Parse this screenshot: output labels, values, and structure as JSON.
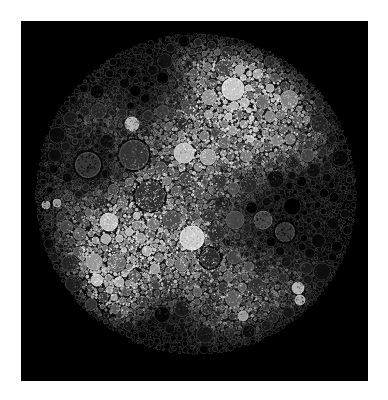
{
  "figure": {
    "title": "",
    "background_color": "#ffffff",
    "plot_background_color": "#000000",
    "frame": {
      "x": 21,
      "y": 21,
      "width": 347,
      "height": 360
    }
  },
  "chart_data": {
    "type": "circle-pack",
    "title": "",
    "subtitle": "",
    "xlabel": "",
    "ylabel": "",
    "grid": false,
    "legend": false,
    "colormap": "grayscale",
    "colormap_range": [
      "#000000",
      "#f0f0f0"
    ],
    "root": {
      "cx": 196,
      "cy": 194,
      "r": 161,
      "value": 1.0,
      "brightness": 0.06
    },
    "axis_ranges": {
      "x": [
        0,
        347
      ],
      "y": [
        0,
        360
      ]
    },
    "seed": 20240917,
    "total_circles": 3400,
    "depth_levels": 5,
    "brightness_field": {
      "description": "radial-plus-blob luminance field driving circle fill gray level",
      "base": 0.12,
      "blobs": [
        {
          "cx": 258,
          "cy": 96,
          "r": 70,
          "amp": 0.62
        },
        {
          "cx": 120,
          "cy": 232,
          "r": 62,
          "amp": 0.52
        },
        {
          "cx": 104,
          "cy": 302,
          "r": 42,
          "amp": 0.58
        },
        {
          "cx": 196,
          "cy": 150,
          "r": 58,
          "amp": 0.34
        },
        {
          "cx": 176,
          "cy": 250,
          "r": 54,
          "amp": 0.3
        },
        {
          "cx": 240,
          "cy": 300,
          "r": 58,
          "amp": 0.24
        },
        {
          "cx": 298,
          "cy": 180,
          "r": 48,
          "amp": 0.1
        },
        {
          "cx": 108,
          "cy": 120,
          "r": 50,
          "amp": 0.16
        },
        {
          "cx": 196,
          "cy": 60,
          "r": 56,
          "amp": 0.14
        },
        {
          "cx": 300,
          "cy": 260,
          "r": 46,
          "amp": 0.12
        }
      ],
      "dark_blobs": [
        {
          "cx": 300,
          "cy": 215,
          "r": 56,
          "amp": 0.4
        },
        {
          "cx": 150,
          "cy": 80,
          "r": 54,
          "amp": 0.3
        },
        {
          "cx": 96,
          "cy": 168,
          "r": 36,
          "amp": 0.3
        },
        {
          "cx": 150,
          "cy": 330,
          "r": 46,
          "amp": 0.26
        }
      ]
    },
    "highlight_circles": [
      {
        "name": "top-bright-large",
        "cx": 233,
        "cy": 89,
        "r": 11,
        "gray": 0.78
      },
      {
        "name": "upper-mid-bright",
        "cx": 184,
        "cy": 153,
        "r": 10,
        "gray": 0.74
      },
      {
        "name": "upper-mid-bright-small",
        "cx": 208,
        "cy": 157,
        "r": 8,
        "gray": 0.62
      },
      {
        "name": "upper-left-bright",
        "cx": 132,
        "cy": 124,
        "r": 7,
        "gray": 0.72
      },
      {
        "name": "center-bright-large",
        "cx": 192,
        "cy": 238,
        "r": 12,
        "gray": 0.8
      },
      {
        "name": "left-bright",
        "cx": 109,
        "cy": 222,
        "r": 9,
        "gray": 0.74
      },
      {
        "name": "dark-left-ringed",
        "cx": 88,
        "cy": 165,
        "r": 14,
        "gray": 0.22
      },
      {
        "name": "dark-upper-mid",
        "cx": 134,
        "cy": 155,
        "r": 16,
        "gray": 0.2
      },
      {
        "name": "dark-center",
        "cx": 150,
        "cy": 196,
        "r": 16,
        "gray": 0.18
      },
      {
        "name": "dark-center-low",
        "cx": 210,
        "cy": 258,
        "r": 11,
        "gray": 0.16
      },
      {
        "name": "mid-gray-right",
        "cx": 263,
        "cy": 220,
        "r": 9,
        "gray": 0.3
      },
      {
        "name": "mid-gray-right-2",
        "cx": 235,
        "cy": 220,
        "r": 9,
        "gray": 0.28
      },
      {
        "name": "mid-gray-left",
        "cx": 172,
        "cy": 220,
        "r": 9,
        "gray": 0.3
      },
      {
        "name": "mid-gray-lower-right",
        "cx": 285,
        "cy": 232,
        "r": 11,
        "gray": 0.22
      },
      {
        "name": "small-bright-right",
        "cx": 298,
        "cy": 288,
        "r": 6,
        "gray": 0.7
      },
      {
        "name": "small-bright-right-2",
        "cx": 300,
        "cy": 300,
        "r": 5,
        "gray": 0.66
      },
      {
        "name": "small-bright-lower",
        "cx": 243,
        "cy": 316,
        "r": 5,
        "gray": 0.62
      },
      {
        "name": "small-bright-edge-left",
        "cx": 46,
        "cy": 205,
        "r": 4,
        "gray": 0.6
      },
      {
        "name": "small-bright-edge-left-2",
        "cx": 57,
        "cy": 203,
        "r": 4,
        "gray": 0.58
      },
      {
        "name": "bright-lower-left",
        "cx": 97,
        "cy": 280,
        "r": 6,
        "gray": 0.72
      },
      {
        "name": "bright-lower-left-2",
        "cx": 119,
        "cy": 282,
        "r": 5,
        "gray": 0.66
      },
      {
        "name": "bright-mid-low",
        "cx": 147,
        "cy": 251,
        "r": 5,
        "gray": 0.68
      },
      {
        "name": "bright-mid-low-2",
        "cx": 155,
        "cy": 269,
        "r": 5,
        "gray": 0.6
      },
      {
        "name": "bright-top-right-small",
        "cx": 258,
        "cy": 74,
        "r": 5,
        "gray": 0.66
      },
      {
        "name": "bright-top-right-small-2",
        "cx": 270,
        "cy": 88,
        "r": 4,
        "gray": 0.62
      }
    ]
  }
}
